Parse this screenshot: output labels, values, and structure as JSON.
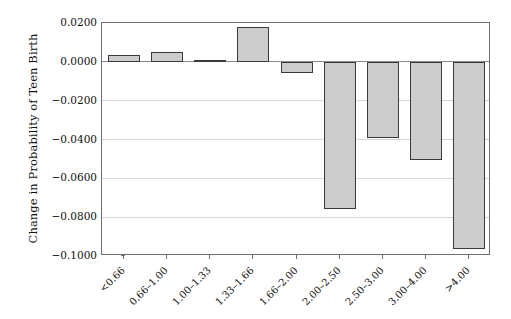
{
  "chart_data": {
    "type": "bar",
    "title": "",
    "subtitle": "",
    "xlabel": "",
    "ylabel": "Change in Probability of Teen Birth",
    "categories": [
      "<0.66",
      "0.66–1.00",
      "1.00–1.33",
      "1.33–1.66",
      "1.66–2.00",
      "2.00–2.50",
      "2.50–3.00",
      "3.00–4.00",
      ">4.00"
    ],
    "values": [
      0.0035,
      0.0052,
      0.0008,
      0.0178,
      -0.0057,
      -0.076,
      -0.039,
      -0.0505,
      -0.0965
    ],
    "series": [
      {
        "name": "Change in Probability of Teen Birth",
        "values": [
          0.0035,
          0.0052,
          0.0008,
          0.0178,
          -0.0057,
          -0.076,
          -0.039,
          -0.0505,
          -0.0965
        ]
      }
    ],
    "ylim": [
      -0.1,
      0.02
    ],
    "yticks": [
      0.02,
      0.0,
      -0.02,
      -0.04,
      -0.06,
      -0.08,
      -0.1
    ],
    "ytick_labels": [
      "0.0200",
      "0.0000",
      "−0.0200",
      "−0.0400",
      "−0.0600",
      "−0.0800",
      "−0.1000"
    ],
    "grid": true,
    "grid_axis": "y",
    "legend": false,
    "legend_position": "none",
    "bar_fill_color": "#cccccc",
    "bar_edge_color": "#3a3a3a",
    "grid_color": "#d6d6d6",
    "axis_color": "#6f6f6f",
    "background_color": "#ffffff",
    "xtick_label_rotation": -45
  }
}
